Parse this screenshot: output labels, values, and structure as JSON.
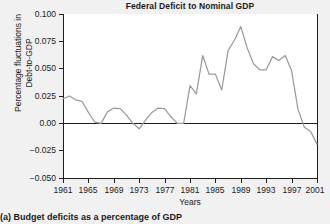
{
  "chart_data": {
    "type": "line",
    "title": "Federal Deficit to Nominal GDP",
    "xlabel": "Years",
    "ylabel_line1": "Percentage fluctuations in",
    "ylabel_line2": "Debt-to-GDP",
    "caption": "(a)  Budget deficits as a percentage of GDP",
    "xlim": [
      1961,
      2001
    ],
    "ylim": [
      -0.05,
      0.1
    ],
    "grid": false,
    "legend": null,
    "line_color": "#9a9a9a",
    "zero_line_color": "#1f1f1f",
    "axis_color": "#1f1f1f",
    "background_color": "#f1f1f1",
    "plot_background_color": "#ffffff",
    "ytick_labels": [
      "0.100",
      "0.075",
      "0.050",
      "0.025",
      "0.00",
      "−0.025",
      "−0.050"
    ],
    "ytick_values": [
      0.1,
      0.075,
      0.05,
      0.025,
      0.0,
      -0.025,
      -0.05
    ],
    "xtick_labels": [
      "1961",
      "1965",
      "1969",
      "1973",
      "1977",
      "1981",
      "1985",
      "1989",
      "1993",
      "1997",
      "2001"
    ],
    "xtick_values": [
      1961,
      1965,
      1969,
      1973,
      1977,
      1981,
      1985,
      1989,
      1993,
      1997,
      2001
    ],
    "series": [
      {
        "name": "Federal Deficit to Nominal GDP",
        "x": [
          1961,
          1962,
          1963,
          1964,
          1965,
          1966,
          1967,
          1968,
          1969,
          1970,
          1971,
          1972,
          1973,
          1974,
          1975,
          1976,
          1977,
          1978,
          1979,
          1980,
          1981,
          1982,
          1983,
          1984,
          1985,
          1986,
          1987,
          1988,
          1989,
          1990,
          1991,
          1992,
          1993,
          1994,
          1995,
          1996,
          1997,
          1998,
          1999,
          2000,
          2001
        ],
        "values": [
          0.0225,
          0.025,
          0.0215,
          0.02,
          0.01,
          0.001,
          0.0,
          0.0105,
          0.014,
          0.0135,
          0.0075,
          0.0,
          -0.005,
          0.003,
          0.01,
          0.014,
          0.0135,
          0.006,
          0.0,
          0.0,
          0.0345,
          0.027,
          0.062,
          0.045,
          0.045,
          0.0305,
          0.0665,
          0.076,
          0.0885,
          0.069,
          0.0545,
          0.049,
          0.049,
          0.061,
          0.0575,
          0.062,
          0.048,
          0.013,
          -0.0035,
          -0.0075,
          -0.019
        ]
      }
    ]
  }
}
